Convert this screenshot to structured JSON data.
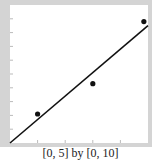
{
  "chart_data": {
    "type": "scatter",
    "title": "",
    "caption": "[0, 5] by [0, 10]",
    "xlabel": "",
    "ylabel": "",
    "xlim": [
      0,
      5
    ],
    "ylim": [
      0,
      10
    ],
    "x_ticks": [
      1,
      2,
      3,
      4
    ],
    "y_ticks": [
      1,
      2,
      3,
      4,
      5,
      6,
      7,
      8,
      9
    ],
    "grid": false,
    "series": [
      {
        "name": "data points",
        "type": "scatter",
        "x": [
          1,
          3,
          4.85
        ],
        "y": [
          2.1,
          4.3,
          8.8
        ]
      },
      {
        "name": "regression line",
        "type": "line",
        "x": [
          0,
          5
        ],
        "y": [
          0,
          8.5
        ]
      }
    ]
  },
  "colors": {
    "frame": "#d4d4d4",
    "plot_bg": "#ffffff",
    "ink": "#111111"
  }
}
